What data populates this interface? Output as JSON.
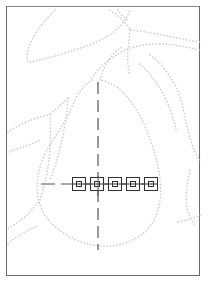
{
  "canvas": {
    "width": 210,
    "height": 285,
    "frame": {
      "x": 6,
      "y": 6,
      "w": 194,
      "h": 270,
      "color": "#6a6a6a"
    },
    "contour_color": "#c8c8c8",
    "guide_color": "#555555",
    "handle_color": "#333333"
  },
  "guides": {
    "vertical": {
      "x": 98,
      "y1": 82,
      "y2": 250
    },
    "horizontal": {
      "y": 184,
      "x1": 41,
      "x2": 158
    }
  },
  "handles": [
    {
      "cx": 79,
      "cy": 184
    },
    {
      "cx": 97,
      "cy": 184
    },
    {
      "cx": 115,
      "cy": 184
    },
    {
      "cx": 133,
      "cy": 184
    },
    {
      "cx": 151,
      "cy": 184
    }
  ],
  "icons": {
    "handle": "square-selection-handle-icon"
  }
}
